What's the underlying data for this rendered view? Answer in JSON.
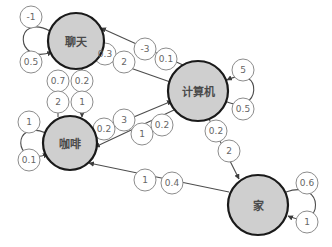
{
  "diagram": {
    "type": "markov-state-transition-graph",
    "title": "",
    "style": {
      "node_fill": "#cfcfcf",
      "node_stroke": "#1a1a1a",
      "bubble_fill": "#ffffff",
      "bubble_stroke": "#8c8c8c",
      "edge_stroke": "#4d4d4d",
      "label_color": "#4a4a4a",
      "bubble_text_color": "#666666",
      "background": "#ffffff"
    },
    "nodes": [
      {
        "id": "chat",
        "label": "聊天",
        "cx": 76,
        "cy": 41,
        "r": 28,
        "font_size": 11
      },
      {
        "id": "computer",
        "label": "计算机",
        "cx": 198,
        "cy": 91,
        "r": 30,
        "font_size": 11
      },
      {
        "id": "coffee",
        "label": "咖啡",
        "cx": 70,
        "cy": 143,
        "r": 27,
        "font_size": 11
      },
      {
        "id": "home",
        "label": "家",
        "cx": 258,
        "cy": 205,
        "r": 30,
        "font_size": 11
      }
    ],
    "edges": [
      {
        "id": "chat-self",
        "from": "chat",
        "to": "chat",
        "labels": [
          "-1",
          "0.5"
        ]
      },
      {
        "id": "coffee-self",
        "from": "coffee",
        "to": "coffee",
        "labels": [
          "1",
          "0.1"
        ]
      },
      {
        "id": "computer-self",
        "from": "computer",
        "to": "computer",
        "labels": [
          "5",
          "0.5"
        ]
      },
      {
        "id": "home-self",
        "from": "home",
        "to": "home",
        "labels": [
          "0.6",
          "1"
        ]
      },
      {
        "id": "chat-to-computer",
        "from": "chat",
        "to": "computer",
        "labels": [
          "0.3",
          "2"
        ]
      },
      {
        "id": "computer-to-chat",
        "from": "computer",
        "to": "chat",
        "labels": [
          "-3",
          "0.1"
        ]
      },
      {
        "id": "coffee-to-chat",
        "from": "coffee",
        "to": "chat",
        "labels": [
          "0.7",
          "2"
        ]
      },
      {
        "id": "chat-to-coffee",
        "from": "chat",
        "to": "coffee",
        "labels": [
          "0.2",
          "1"
        ]
      },
      {
        "id": "coffee-to-computer",
        "from": "coffee",
        "to": "computer",
        "labels": [
          "0.2",
          "3"
        ]
      },
      {
        "id": "computer-to-coffee",
        "from": "computer",
        "to": "coffee",
        "labels": [
          "1",
          "0.2"
        ]
      },
      {
        "id": "computer-to-home",
        "from": "computer",
        "to": "home",
        "labels": [
          "0.2",
          "2"
        ]
      },
      {
        "id": "home-to-coffee",
        "from": "home",
        "to": "coffee",
        "labels": [
          "1",
          "0.4"
        ]
      }
    ],
    "bubbles": [
      {
        "id": "b-chat-self-1",
        "text": "-1",
        "cx": 31,
        "cy": 17,
        "r": 11,
        "font_size": 9
      },
      {
        "id": "b-chat-self-2",
        "text": "0.5",
        "cx": 31,
        "cy": 62,
        "r": 11,
        "font_size": 9
      },
      {
        "id": "b-coffee-self-1",
        "text": "1",
        "cx": 29,
        "cy": 122,
        "r": 11,
        "font_size": 9
      },
      {
        "id": "b-coffee-self-2",
        "text": "0.1",
        "cx": 29,
        "cy": 160,
        "r": 11,
        "font_size": 9
      },
      {
        "id": "b-computer-self-1",
        "text": "5",
        "cx": 243,
        "cy": 70,
        "r": 11,
        "font_size": 9
      },
      {
        "id": "b-computer-self-2",
        "text": "0.5",
        "cx": 243,
        "cy": 109,
        "r": 11,
        "font_size": 9
      },
      {
        "id": "b-home-self-1",
        "text": "0.6",
        "cx": 307,
        "cy": 183,
        "r": 11,
        "font_size": 9
      },
      {
        "id": "b-home-self-2",
        "text": "1",
        "cx": 307,
        "cy": 222,
        "r": 11,
        "font_size": 9
      },
      {
        "id": "b-chat-comp-1",
        "text": "0.3",
        "cx": 105,
        "cy": 54,
        "r": 11,
        "font_size": 9
      },
      {
        "id": "b-chat-comp-2",
        "text": "2",
        "cx": 124,
        "cy": 62,
        "r": 11,
        "font_size": 9
      },
      {
        "id": "b-comp-chat-1",
        "text": "-3",
        "cx": 145,
        "cy": 49,
        "r": 11,
        "font_size": 9
      },
      {
        "id": "b-comp-chat-2",
        "text": "0.1",
        "cx": 166,
        "cy": 59,
        "r": 11,
        "font_size": 9
      },
      {
        "id": "b-coffee-chat-1",
        "text": "0.7",
        "cx": 58,
        "cy": 81,
        "r": 11,
        "font_size": 9
      },
      {
        "id": "b-coffee-chat-2",
        "text": "2",
        "cx": 58,
        "cy": 102,
        "r": 11,
        "font_size": 9
      },
      {
        "id": "b-chat-coffee-1",
        "text": "0.2",
        "cx": 82,
        "cy": 81,
        "r": 11,
        "font_size": 9
      },
      {
        "id": "b-chat-coffee-2",
        "text": "1",
        "cx": 82,
        "cy": 102,
        "r": 11,
        "font_size": 9
      },
      {
        "id": "b-coffee-comp-1",
        "text": "0.2",
        "cx": 104,
        "cy": 129,
        "r": 11,
        "font_size": 9
      },
      {
        "id": "b-coffee-comp-2",
        "text": "3",
        "cx": 124,
        "cy": 120,
        "r": 11,
        "font_size": 9
      },
      {
        "id": "b-comp-coffee-1",
        "text": "1",
        "cx": 142,
        "cy": 134,
        "r": 11,
        "font_size": 9
      },
      {
        "id": "b-comp-coffee-2",
        "text": "0.2",
        "cx": 162,
        "cy": 125,
        "r": 11,
        "font_size": 9
      },
      {
        "id": "b-comp-home-1",
        "text": "0.2",
        "cx": 216,
        "cy": 131,
        "r": 11,
        "font_size": 9
      },
      {
        "id": "b-comp-home-2",
        "text": "2",
        "cx": 229,
        "cy": 151,
        "r": 11,
        "font_size": 9
      },
      {
        "id": "b-home-coffee-1",
        "text": "1",
        "cx": 145,
        "cy": 180,
        "r": 11,
        "font_size": 9
      },
      {
        "id": "b-home-coffee-2",
        "text": "0.4",
        "cx": 172,
        "cy": 183,
        "r": 11,
        "font_size": 9
      }
    ]
  }
}
